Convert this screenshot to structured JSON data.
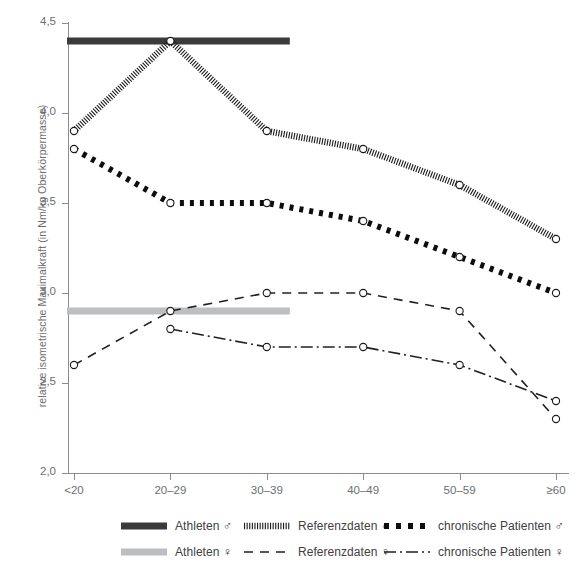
{
  "chart_data": {
    "type": "line",
    "title": "",
    "xlabel": "",
    "ylabel": "relative isometrische Maximalkraft (in Nm/kg Oberkörpermasse)",
    "categories": [
      "<20",
      "20–29",
      "30–39",
      "40–49",
      "50–59",
      "≥60"
    ],
    "ylim": [
      2.0,
      4.5
    ],
    "ytick_labels": [
      "2,0",
      "2,5",
      "3,0",
      "3,5",
      "4,0",
      "4,5"
    ],
    "ytick_values": [
      2.0,
      2.5,
      3.0,
      3.5,
      4.0,
      4.5
    ],
    "grid": false,
    "legend_position": "bottom",
    "series": [
      {
        "name": "Athleten ♂",
        "style": "thick-solid-bar",
        "color": "#3b3b3b",
        "kind": "reference-band",
        "value": 4.4,
        "x_start": "<20",
        "x_end": "30–39",
        "values": [
          4.4,
          4.4,
          4.4,
          null,
          null,
          null
        ]
      },
      {
        "name": "Referenzdaten ♂",
        "style": "dense-hatched-thick",
        "color": "#1a1a1a",
        "kind": "line-markers",
        "values": [
          3.9,
          4.4,
          3.9,
          3.8,
          3.6,
          3.3
        ]
      },
      {
        "name": "chronische Patienten ♂",
        "style": "thick-dashed",
        "color": "#0d0d0d",
        "kind": "line-markers",
        "values": [
          3.8,
          3.5,
          3.5,
          3.4,
          3.2,
          3.0
        ]
      },
      {
        "name": "Athleten ♀",
        "style": "thick-solid-bar",
        "color": "#bcbec0",
        "kind": "reference-band",
        "value": 2.9,
        "x_start": "<20",
        "x_end": "30–39",
        "values": [
          2.9,
          2.9,
          2.9,
          null,
          null,
          null
        ]
      },
      {
        "name": "Referenzdaten ♀",
        "style": "dashed",
        "color": "#231f20",
        "kind": "line-markers",
        "values": [
          2.6,
          2.9,
          3.0,
          3.0,
          2.9,
          2.3
        ]
      },
      {
        "name": "chronische Patienten ♀",
        "style": "dash-dot",
        "color": "#231f20",
        "kind": "line-markers",
        "values": [
          null,
          2.8,
          2.7,
          2.7,
          2.6,
          2.4
        ]
      }
    ]
  },
  "legend": {
    "rows": [
      [
        {
          "label": "Athleten",
          "sex": "♂",
          "style": "thick-solid-bar",
          "color": "#3b3b3b"
        },
        {
          "label": "Referenzdaten",
          "sex": "♂",
          "style": "dense-hatched-thick",
          "color": "#1a1a1a"
        },
        {
          "label": "chronische Patienten",
          "sex": "♂",
          "style": "thick-dashed",
          "color": "#0d0d0d"
        }
      ],
      [
        {
          "label": "Athleten",
          "sex": "♀",
          "style": "thick-solid-bar",
          "color": "#bcbec0"
        },
        {
          "label": "Referenzdaten",
          "sex": "♀",
          "style": "dashed",
          "color": "#231f20"
        },
        {
          "label": "chronische Patienten",
          "sex": "♀",
          "style": "dash-dot",
          "color": "#231f20"
        }
      ]
    ]
  }
}
